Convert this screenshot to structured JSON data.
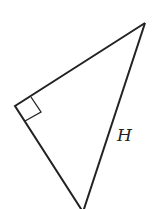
{
  "diagram": {
    "type": "right-triangle",
    "colors": {
      "stroke": "#222222",
      "background": "#ffffff"
    },
    "vertices": {
      "right_angle": [
        15,
        106
      ],
      "top": [
        145,
        23
      ],
      "bottom": [
        83,
        212
      ]
    },
    "right_angle_marker": [
      [
        31,
        97
      ],
      [
        41,
        112
      ],
      [
        25,
        121
      ]
    ],
    "labels": {
      "hypotenuse": "H"
    }
  }
}
